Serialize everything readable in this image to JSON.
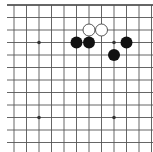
{
  "board": {
    "description": "Go board fragment (top-left region, 12x12 visible intersections)",
    "colors": {
      "background": "#ffffff",
      "line": "#555555",
      "border": "#333333",
      "black_stone": "#111111",
      "white_stone": "#ffffff",
      "white_stone_edge": "#444444"
    },
    "grid": {
      "x_lines": [
        14,
        26.5,
        39,
        51.5,
        64,
        76.5,
        89,
        101.5,
        114,
        126.5,
        139,
        151.5
      ],
      "y_lines": [
        5,
        17.5,
        30,
        42.5,
        55,
        67.5,
        80,
        92.5,
        105,
        117.5,
        130,
        142.5
      ],
      "line_x_start": 7,
      "line_x_end": 153,
      "line_y_end": 152,
      "top_border": true
    },
    "star_points": [
      {
        "col": 2,
        "row": 3
      },
      {
        "col": 8,
        "row": 3
      },
      {
        "col": 2,
        "row": 9
      },
      {
        "col": 8,
        "row": 9
      }
    ],
    "stones": [
      {
        "color": "black",
        "col": 5,
        "row": 3
      },
      {
        "color": "black",
        "col": 6,
        "row": 3
      },
      {
        "color": "black",
        "col": 9,
        "row": 3
      },
      {
        "color": "black",
        "col": 8,
        "row": 4
      },
      {
        "color": "white",
        "col": 6,
        "row": 2
      },
      {
        "color": "white",
        "col": 7,
        "row": 2
      }
    ],
    "stone_radius": 6
  }
}
